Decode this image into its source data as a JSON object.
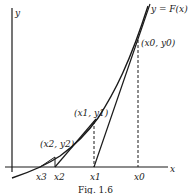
{
  "diagram": {
    "axes": {
      "x_label": "x",
      "y_label": "y"
    },
    "curve_label": "y = F(x)",
    "points": [
      {
        "label": "(x0, y0)"
      },
      {
        "label": "(x1, y1)"
      },
      {
        "label": "(x2, y2)"
      }
    ],
    "x_ticks": [
      "x0",
      "x1",
      "x2",
      "x3"
    ],
    "caption": "Fig. 1.6"
  },
  "colors": {
    "ink": "#1a1a1a",
    "background": "#ffffff"
  }
}
